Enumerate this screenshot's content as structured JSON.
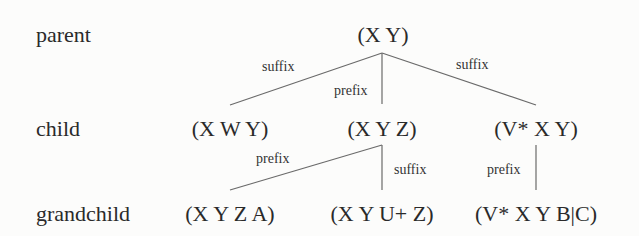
{
  "levels": {
    "parent": "parent",
    "child": "child",
    "grandchild": "grandchild"
  },
  "nodes": {
    "parent": "(X Y)",
    "child_1": "(X W Y)",
    "child_2": "(X Y Z)",
    "child_3": "(V* X Y)",
    "grandchild_1": "(X Y Z A)",
    "grandchild_2": "(X Y U+ Z)",
    "grandchild_3": "(V* X Y B|C)"
  },
  "edges": [
    {
      "from": "parent",
      "to": "child_1",
      "label": "suffix"
    },
    {
      "from": "parent",
      "to": "child_2",
      "label": "prefix"
    },
    {
      "from": "parent",
      "to": "child_3",
      "label": "suffix"
    },
    {
      "from": "child_2",
      "to": "grandchild_1",
      "label": "prefix"
    },
    {
      "from": "child_2",
      "to": "grandchild_2",
      "label": "suffix"
    },
    {
      "from": "child_3",
      "to": "grandchild_3",
      "label": "prefix"
    }
  ]
}
